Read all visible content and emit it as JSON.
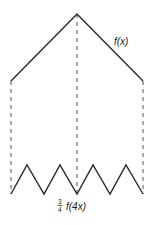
{
  "diagram": {
    "top_curve": {
      "label": "f(x)",
      "points": [
        [
          11,
          81
        ],
        [
          77,
          14
        ],
        [
          143,
          81
        ]
      ]
    },
    "bottom_curve": {
      "label_fraction_numerator": "3",
      "label_fraction_denominator": "4",
      "label_func": "f(4x)",
      "points": [
        [
          11,
          194
        ],
        [
          27,
          165
        ],
        [
          44,
          194
        ],
        [
          60,
          165
        ],
        [
          77,
          194
        ],
        [
          93,
          165
        ],
        [
          110,
          194
        ],
        [
          126,
          165
        ],
        [
          143,
          194
        ]
      ]
    },
    "dashed_lines": [
      {
        "x": 11,
        "y1": 81,
        "y2": 194
      },
      {
        "x": 77,
        "y1": 14,
        "y2": 194
      },
      {
        "x": 143,
        "y1": 81,
        "y2": 194
      }
    ],
    "colors": {
      "stroke": "#2a2a2a",
      "background": "#ffffff"
    }
  }
}
